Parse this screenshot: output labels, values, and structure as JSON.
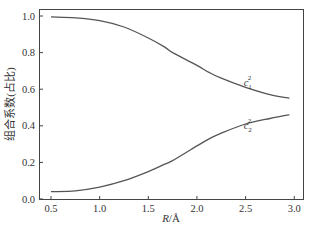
{
  "chart_data": {
    "type": "line",
    "title": "",
    "xlabel": "R/Å",
    "xlabel_italic_part": "R",
    "xlabel_rest": "/Å",
    "ylabel": "组合系数(占比)",
    "xlim": [
      0.4,
      3.1
    ],
    "ylim": [
      0.0,
      1.05
    ],
    "xticks": [
      0.5,
      1.0,
      1.5,
      2.0,
      2.5,
      3.0
    ],
    "xtick_labels": [
      "0.5",
      "1.0",
      "1.5",
      "2.0",
      "2.5",
      "3.0"
    ],
    "yticks": [
      0.0,
      0.2,
      0.4,
      0.6,
      0.8,
      1.0
    ],
    "ytick_labels": [
      "0.0",
      "0.2",
      "0.4",
      "0.6",
      "0.8",
      "1.0"
    ],
    "grid": false,
    "legend": "none (inline curve labels)",
    "series": [
      {
        "name": "c1^2",
        "label_base": "c",
        "label_sub": "1",
        "label_sup": "2",
        "label_pos": [
          2.48,
          0.62
        ],
        "x": [
          0.5,
          0.75,
          1.0,
          1.25,
          1.5,
          1.67,
          1.75,
          2.0,
          2.13,
          2.25,
          2.5,
          2.75,
          2.95
        ],
        "y": [
          0.995,
          0.99,
          0.975,
          0.94,
          0.88,
          0.83,
          0.8,
          0.73,
          0.69,
          0.66,
          0.61,
          0.57,
          0.55
        ]
      },
      {
        "name": "c2^2",
        "label_base": "c",
        "label_sub": "2",
        "label_sup": "2",
        "label_pos": [
          2.48,
          0.385
        ],
        "x": [
          0.5,
          0.75,
          1.0,
          1.25,
          1.5,
          1.67,
          1.75,
          2.0,
          2.13,
          2.25,
          2.5,
          2.75,
          2.95
        ],
        "y": [
          0.04,
          0.045,
          0.065,
          0.1,
          0.15,
          0.19,
          0.21,
          0.29,
          0.33,
          0.36,
          0.41,
          0.44,
          0.46
        ]
      }
    ]
  },
  "style": {
    "line_color": "#555555",
    "axis_color": "#444444",
    "text_color": "#333333"
  }
}
